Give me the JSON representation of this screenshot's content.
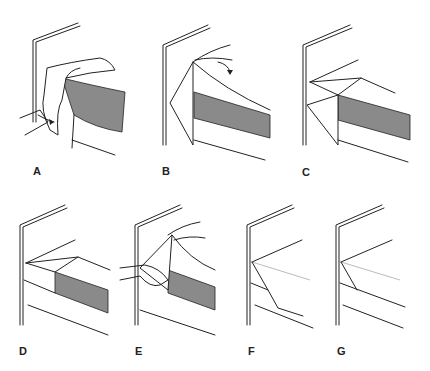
{
  "figure": {
    "panels": [
      {
        "id": "A",
        "label": "A",
        "description": "Tucking sheet under mattress at corner, hand with curved arrow"
      },
      {
        "id": "B",
        "label": "B",
        "description": "Lifting sheet edge to form triangle, curved arrow"
      },
      {
        "id": "C",
        "label": "C",
        "description": "Triangle laid on top of mattress"
      },
      {
        "id": "D",
        "label": "D",
        "description": "Sheet tucked under mattress below triangle"
      },
      {
        "id": "E",
        "label": "E",
        "description": "Holding fold with one hand, bringing triangle down"
      },
      {
        "id": "F",
        "label": "F",
        "description": "Triangle brought down over side of mattress"
      },
      {
        "id": "G",
        "label": "G",
        "description": "Finished mitered corner tucked in"
      }
    ],
    "colors": {
      "line": "#222222",
      "mattress_side": "#8a8a8a",
      "background": "#ffffff"
    }
  }
}
